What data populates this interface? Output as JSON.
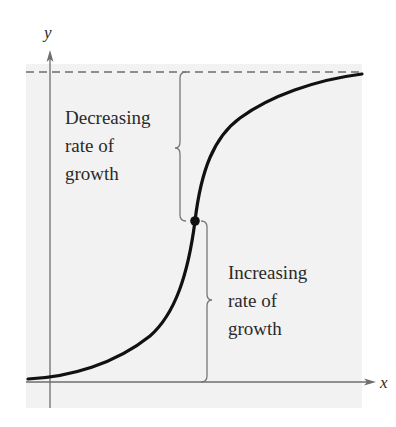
{
  "diagram": {
    "type": "logistic growth curve (sigmoid) with inflection point",
    "colors": {
      "panel_background": "#f2f2f2",
      "curve": "#111111",
      "axes": "#6e6e6e",
      "asymptote": "#6e6e6e",
      "braces": "#777777",
      "text": "#2a2a2a"
    },
    "axes": {
      "x_label": "x",
      "y_label": "y"
    },
    "asymptote": {
      "style": "dashed",
      "description": "horizontal upper limit (carrying capacity)"
    },
    "inflection_point": {
      "marker": "filled-circle"
    },
    "annotations": {
      "upper": {
        "lines": [
          "Decreasing",
          "rate of",
          "growth"
        ]
      },
      "lower": {
        "lines": [
          "Increasing",
          "rate of",
          "growth"
        ]
      }
    }
  }
}
